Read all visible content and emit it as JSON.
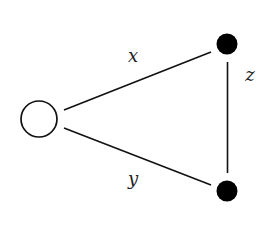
{
  "diagram": {
    "type": "graph",
    "nodes": [
      {
        "id": "left",
        "style": "open",
        "cx": 39,
        "cy": 119,
        "r": 18
      },
      {
        "id": "top-right",
        "style": "filled",
        "cx": 227,
        "cy": 44,
        "r": 10.5
      },
      {
        "id": "bottom-right",
        "style": "filled",
        "cx": 227,
        "cy": 191,
        "r": 10.5
      }
    ],
    "edges": [
      {
        "from": "left",
        "to": "top-right",
        "label": "x",
        "x1": 64,
        "y1": 110,
        "x2": 211,
        "y2": 52,
        "label_x": 133,
        "label_y": 57
      },
      {
        "from": "left",
        "to": "bottom-right",
        "label": "y",
        "x1": 64,
        "y1": 128,
        "x2": 211,
        "y2": 185,
        "label_x": 133,
        "label_y": 180
      },
      {
        "from": "top-right",
        "to": "bottom-right",
        "label": "z",
        "x1": 227.5,
        "y1": 62,
        "x2": 227.5,
        "y2": 173,
        "label_x": 250,
        "label_y": 76
      }
    ],
    "colors": {
      "stroke": "#111111",
      "filled_node": "#000000",
      "open_node_fill": "#ffffff",
      "background": "#ffffff"
    }
  }
}
